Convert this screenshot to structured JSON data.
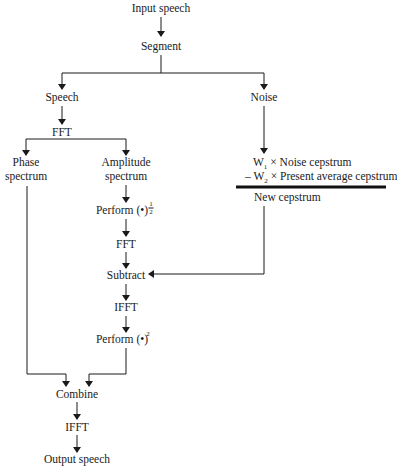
{
  "diagram": {
    "type": "flowchart",
    "nodes": {
      "input": "Input speech",
      "segment": "Segment",
      "speech": "Speech",
      "noise": "Noise",
      "fft1": "FFT",
      "phase_line1": "Phase",
      "phase_line2": "spectrum",
      "amp_line1": "Amplitude",
      "amp_line2": "spectrum",
      "perform_sqrt": "Perform (•)",
      "perform_sqrt_exp_num": "1",
      "perform_sqrt_exp_den": "2",
      "fft2": "FFT",
      "subtract": "Subtract",
      "ifft1": "IFFT",
      "perform_sq": "Perform (•)",
      "perform_sq_exp": "2",
      "combine": "Combine",
      "ifft2": "IFFT",
      "output": "Output speech",
      "cep_line1_w": "W",
      "cep_line1_sub": "1",
      "cep_line1_rest": " × Noise cepstrum",
      "cep_line2_w": "– W",
      "cep_line2_sub": "2",
      "cep_line2_rest": " × Present average cepstrum",
      "new_cepstrum": "New cepstrum"
    },
    "edges": [
      [
        "input",
        "segment"
      ],
      [
        "segment",
        "speech"
      ],
      [
        "segment",
        "noise"
      ],
      [
        "speech",
        "fft1"
      ],
      [
        "fft1",
        "phase"
      ],
      [
        "fft1",
        "amplitude"
      ],
      [
        "amplitude",
        "perform_sqrt"
      ],
      [
        "perform_sqrt",
        "fft2"
      ],
      [
        "fft2",
        "subtract"
      ],
      [
        "noise",
        "cepstrum_formula"
      ],
      [
        "new_cepstrum",
        "subtract"
      ],
      [
        "subtract",
        "ifft1"
      ],
      [
        "ifft1",
        "perform_sq"
      ],
      [
        "phase",
        "combine"
      ],
      [
        "perform_sq",
        "combine"
      ],
      [
        "combine",
        "ifft2"
      ],
      [
        "ifft2",
        "output"
      ]
    ]
  }
}
